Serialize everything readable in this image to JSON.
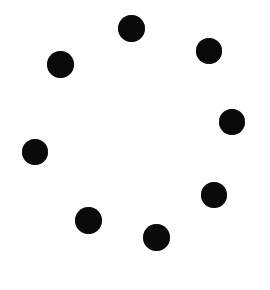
{
  "widget": {
    "name": "loading-spinner",
    "type": "circular-dot-spinner",
    "description": "Eight solid black dots arranged in a ring on a plain white background",
    "canvas": {
      "width": 270,
      "height": 290,
      "background_color": "#ffffff"
    },
    "ring": {
      "center_x": 134,
      "center_y": 132,
      "radius": 105,
      "dot_count": 8,
      "dot_diameter": 26,
      "dot_color": "#0a0a0a"
    },
    "dots": [
      {
        "name": "dot-top",
        "position_label": "top",
        "angle_deg": -87,
        "cx": 131,
        "cy": 28,
        "d": 27,
        "color": "#0a0a0a"
      },
      {
        "name": "dot-upper-right",
        "position_label": "upper-right",
        "angle_deg": -51,
        "cx": 209,
        "cy": 51,
        "d": 26,
        "color": "#0a0a0a"
      },
      {
        "name": "dot-right",
        "position_label": "right",
        "angle_deg": -5,
        "cx": 232,
        "cy": 122,
        "d": 26,
        "color": "#0a0a0a"
      },
      {
        "name": "dot-lower-right",
        "position_label": "lower-right",
        "angle_deg": 38,
        "cx": 214,
        "cy": 195,
        "d": 26,
        "color": "#0a0a0a"
      },
      {
        "name": "dot-bottom",
        "position_label": "bottom",
        "angle_deg": 78,
        "cx": 156,
        "cy": 237,
        "d": 27,
        "color": "#0a0a0a"
      },
      {
        "name": "dot-lower-left",
        "position_label": "lower-left",
        "angle_deg": 120,
        "cx": 88,
        "cy": 220,
        "d": 27,
        "color": "#0a0a0a"
      },
      {
        "name": "dot-left",
        "position_label": "left",
        "angle_deg": 169,
        "cx": 35,
        "cy": 152,
        "d": 26,
        "color": "#0a0a0a"
      },
      {
        "name": "dot-upper-left",
        "position_label": "upper-left",
        "angle_deg": -132,
        "cx": 60,
        "cy": 64,
        "d": 27,
        "color": "#0a0a0a"
      }
    ]
  }
}
